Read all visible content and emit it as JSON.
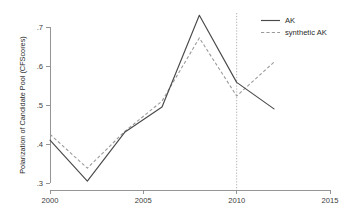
{
  "chart_data": {
    "type": "line",
    "title": "",
    "xlabel": "",
    "ylabel": "Polarization of Candidate Pool (CFScores)",
    "xlim": [
      2000,
      2015
    ],
    "ylim": [
      0.3,
      0.7
    ],
    "grid": false,
    "legend_position": "top-right",
    "x_ticks": [
      "2000",
      "2005",
      "2010",
      "2015"
    ],
    "x_tick_values": [
      2000,
      2005,
      2010,
      2015
    ],
    "y_ticks": [
      ".3",
      ".4",
      ".5",
      ".6",
      ".7"
    ],
    "y_tick_values": [
      0.3,
      0.4,
      0.5,
      0.6,
      0.7
    ],
    "x": [
      2000,
      2002,
      2004,
      2006,
      2008,
      2010,
      2012
    ],
    "series": [
      {
        "name": "AK",
        "style": "solid",
        "color": "#4a4a4a",
        "values": [
          0.41,
          0.305,
          0.43,
          0.495,
          0.73,
          0.558,
          0.49
        ]
      },
      {
        "name": "synthetic AK",
        "style": "dashed",
        "color": "#9a9a9a",
        "values": [
          0.425,
          0.338,
          0.432,
          0.51,
          0.672,
          0.523,
          0.61
        ]
      }
    ],
    "annotations": [
      {
        "name": "intervention-line",
        "type": "vertical-dotted-line",
        "x": 2010,
        "color": "#a8a8a8"
      }
    ],
    "legend": [
      {
        "label": "AK",
        "style": "solid"
      },
      {
        "label": "synthetic AK",
        "style": "dashed"
      }
    ]
  }
}
